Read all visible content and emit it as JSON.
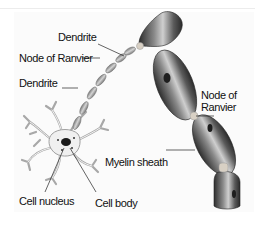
{
  "diagram": {
    "labels": {
      "dendrite_top": "Dendrite",
      "node_ranvier_left": "Node of Ranvier",
      "dendrite_left": "Dendrite",
      "node_ranvier_right_line1": "Node of",
      "node_ranvier_right_line2": "Ranvier",
      "myelin_sheath": "Myelin sheath",
      "cell_nucleus": "Cell nucleus",
      "cell_body": "Cell body"
    },
    "colors": {
      "myelin_dark": "#3a3a3a",
      "myelin_mid": "#7a7a7a",
      "myelin_highlight": "#cfcfcf",
      "node": "#d8d0c4",
      "dendrite_outline": "#9a9a9a",
      "text": "#111111"
    }
  }
}
